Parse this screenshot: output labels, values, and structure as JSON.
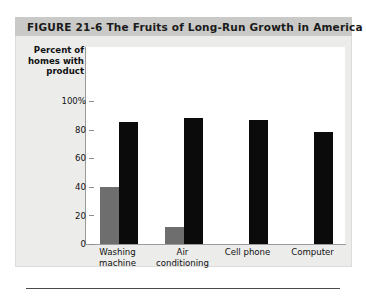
{
  "figure": {
    "number": "FIGURE  21-6",
    "title": "The Fruits of Long-Run Growth in America",
    "full_title": "FIGURE  21-6  The Fruits of Long-Run Growth in America"
  },
  "chart_data": {
    "type": "bar",
    "title": "The Fruits of Long-Run Growth in America",
    "xlabel": "",
    "ylabel": "Percent of homes with product",
    "ylabel_line1": "Percent of",
    "ylabel_line2": "homes with",
    "ylabel_line3": "product",
    "categories": [
      "Washing machine",
      "Air conditioning",
      "Cell phone",
      "Computer"
    ],
    "category_lines": [
      [
        "Washing",
        "machine"
      ],
      [
        "Air",
        "conditioning"
      ],
      [
        "Cell phone",
        ""
      ],
      [
        "Computer",
        ""
      ]
    ],
    "series": [
      {
        "name": "1960",
        "color": "#6e6e6e",
        "values": [
          40,
          12,
          null,
          null
        ]
      },
      {
        "name": "2011",
        "color": "#0b0b0b",
        "values": [
          85,
          88,
          87,
          78
        ]
      }
    ],
    "ylim": [
      0,
      100
    ],
    "yticks": [
      100,
      80,
      60,
      40,
      20,
      0
    ],
    "ytick_labels": [
      "100%",
      "80",
      "60",
      "40",
      "20",
      "0"
    ],
    "grid": false,
    "legend_position": "top-right"
  },
  "colors": {
    "series_1960": "#6e6e6e",
    "series_2011": "#0b0b0b",
    "panel_background": "#ececeb",
    "banner_background": "#c9c9c7",
    "plot_background": "#ffffff",
    "axis": "#9a9a9a"
  }
}
